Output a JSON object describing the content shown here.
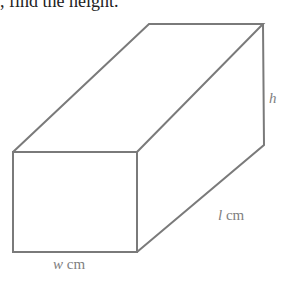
{
  "caption": ", find the height.",
  "figure": {
    "type": "cuboid",
    "stroke_color": "#7a7a7a",
    "label_color": "#808080",
    "labels": {
      "height": {
        "var": "h",
        "unit": ""
      },
      "length": {
        "var": "l",
        "unit": "cm"
      },
      "width": {
        "var": "w",
        "unit": "cm"
      }
    }
  }
}
